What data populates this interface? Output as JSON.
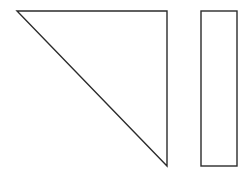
{
  "canvas": {
    "width": 249,
    "height": 178,
    "background": "#ffffff"
  },
  "stroke": {
    "color": "#2b2b2b",
    "width": 1.4
  },
  "shapes": [
    {
      "type": "triangle",
      "name": "right-triangle",
      "points": [
        [
          17,
          11
        ],
        [
          167,
          11
        ],
        [
          167,
          166
        ]
      ],
      "fill": "#ffffff"
    },
    {
      "type": "rectangle",
      "name": "tall-rectangle",
      "x": 201,
      "y": 11,
      "width": 36,
      "height": 155,
      "fill": "#ffffff"
    }
  ]
}
